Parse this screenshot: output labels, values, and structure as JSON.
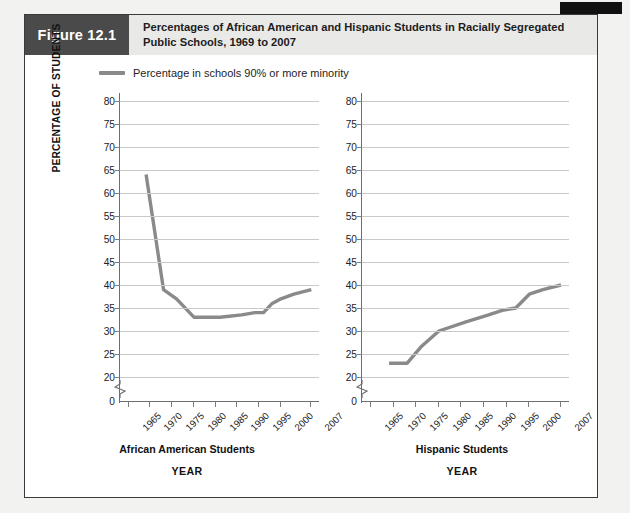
{
  "figure": {
    "badge_label": "Figure 12.1",
    "title": "Percentages of African American and Hispanic Students in Racially Segregated Public Schools, 1969 to 2007"
  },
  "legend": {
    "swatch_name": "line-swatch",
    "label": "Percentage in schools 90% or more minority",
    "color": "#8a8a8a"
  },
  "axes": {
    "y_title": "PERCENTAGE OF STUDENTS",
    "y_ticks": [
      "80",
      "75",
      "70",
      "65",
      "60",
      "55",
      "50",
      "45",
      "40",
      "35",
      "30",
      "25",
      "20"
    ],
    "y_zero": "0",
    "x_ticks": [
      "1965",
      "1970",
      "1975",
      "1980",
      "1985",
      "1990",
      "1995",
      "2000",
      "2007"
    ],
    "x_title": "YEAR"
  },
  "panels": {
    "left": {
      "caption": "African American Students",
      "x_title": "YEAR"
    },
    "right": {
      "caption": "Hispanic Students",
      "x_title": "YEAR"
    }
  },
  "chart_data": {
    "type": "line",
    "title": "Percentages of African American and Hispanic Students in Racially Segregated Public Schools, 1969 to 2007",
    "xlabel": "YEAR",
    "ylabel": "PERCENTAGE OF STUDENTS",
    "ylim": [
      20,
      80
    ],
    "y_axis_break_below": 20,
    "xlim": [
      1963,
      2009
    ],
    "x_tick_values": [
      1965,
      1970,
      1975,
      1980,
      1985,
      1990,
      1995,
      2000,
      2007
    ],
    "grid": true,
    "legend_position": "top-left",
    "legend_entries": [
      "Percentage in schools 90% or more minority"
    ],
    "panels": [
      {
        "name": "African American Students",
        "series": [
          {
            "name": "Percentage in schools 90% or more minority",
            "color": "#8a8a8a",
            "x": [
              1969,
              1973,
              1976,
              1980,
              1986,
              1991,
              1994,
              1996,
              1998,
              2000,
              2003,
              2007
            ],
            "values": [
              64,
              39,
              37,
              33,
              33,
              33.5,
              34,
              34,
              36,
              37,
              38,
              39
            ]
          }
        ]
      },
      {
        "name": "Hispanic Students",
        "series": [
          {
            "name": "Percentage in schools 90% or more minority",
            "color": "#8a8a8a",
            "x": [
              1969,
              1973,
              1976,
              1980,
              1986,
              1991,
              1994,
              1997,
              2000,
              2003,
              2007
            ],
            "values": [
              23,
              23,
              26.5,
              30,
              32,
              33.5,
              34.5,
              35,
              38,
              39,
              40
            ]
          }
        ]
      }
    ]
  }
}
